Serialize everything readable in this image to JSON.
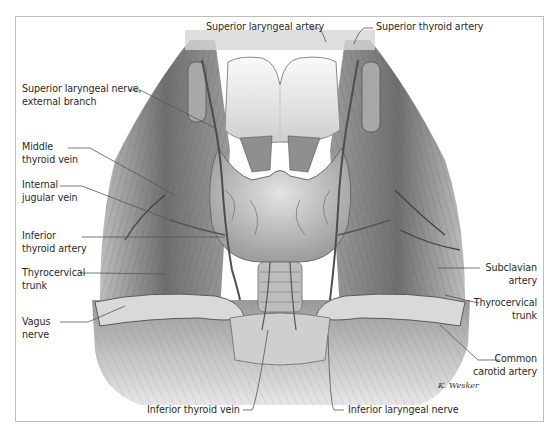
{
  "figure": {
    "signature": "K. Wesker",
    "colors": {
      "frame_border": "#bdbdbd",
      "label_text": "#2a2a2a",
      "leader_line": "#555555",
      "tissue_dark": "#4a4a4a",
      "tissue_mid": "#8c8c8c",
      "tissue_light": "#d9d9d9",
      "cartilage": "#eeeeee"
    }
  },
  "labels": {
    "superior_laryngeal_artery": "Superior laryngeal artery",
    "superior_thyroid_artery": "Superior thyroid artery",
    "superior_laryngeal_nerve_line1": "Superior laryngeal nerve,",
    "superior_laryngeal_nerve_line2": "external branch",
    "middle_thyroid_vein_line1": "Middle",
    "middle_thyroid_vein_line2": "thyroid vein",
    "internal_jugular_vein_line1": "Internal",
    "internal_jugular_vein_line2": "jugular vein",
    "inferior_thyroid_artery_line1": "Inferior",
    "inferior_thyroid_artery_line2": "thyroid artery",
    "thyrocervical_trunk_left_line1": "Thyrocervical",
    "thyrocervical_trunk_left_line2": "trunk",
    "vagus_nerve_line1": "Vagus",
    "vagus_nerve_line2": "nerve",
    "subclavian_artery_line1": "Subclavian",
    "subclavian_artery_line2": "artery",
    "thyrocervical_trunk_right_line1": "Thyrocervical",
    "thyrocervical_trunk_right_line2": "trunk",
    "common_carotid_artery_line1": "Common",
    "common_carotid_artery_line2": "carotid artery",
    "inferior_thyroid_vein": "Inferior thyroid vein",
    "inferior_laryngeal_nerve": "Inferior laryngeal nerve"
  }
}
